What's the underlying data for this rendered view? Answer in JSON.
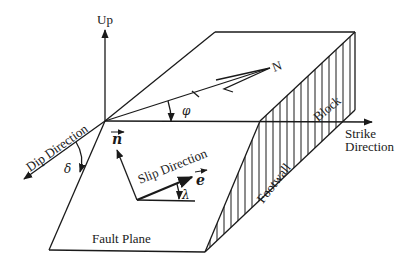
{
  "diagram": {
    "labels": {
      "up": "Up",
      "north": "N",
      "strike_direction_line1": "Strike",
      "strike_direction_line2": "Direction",
      "dip_direction": "Dip Direction",
      "slip_direction": "Slip Direction",
      "footwall": "Footwall",
      "block": "Block",
      "fault_plane": "Fault Plane"
    },
    "symbols": {
      "phi": "φ",
      "delta": "δ",
      "lambda": "λ",
      "normal_vector": "n",
      "slip_vector": "e"
    },
    "colors": {
      "ink": "#1a1a1a",
      "background": "#ffffff"
    }
  }
}
